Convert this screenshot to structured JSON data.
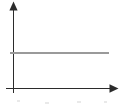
{
  "figure": {
    "title": "",
    "width": 121,
    "height": 109,
    "background_color": "#ffffff",
    "caption": ""
  },
  "axes": {
    "x_axis": {
      "name": "x-axis",
      "label": "",
      "color": "#2b2b2b",
      "arrow": "right-arrowhead",
      "start_x": 6,
      "end_x": 118,
      "y": 88,
      "ticks": [],
      "tick_labels": []
    },
    "y_axis": {
      "name": "y-axis",
      "label": "",
      "color": "#2b2b2b",
      "arrow": "up-arrowhead",
      "x": 13,
      "start_y": 93,
      "end_y": 2,
      "ticks": [],
      "tick_labels": []
    }
  },
  "legend": {
    "visible": false,
    "entries": []
  },
  "chart_data": {
    "type": "line",
    "title": "",
    "subtitle": "",
    "xlabel": "",
    "ylabel": "",
    "grid": false,
    "legend_position": "none",
    "xlim": [
      0,
      1
    ],
    "ylim": [
      0,
      1
    ],
    "axis_tick_labels": {
      "x": [],
      "y": []
    },
    "annotations": [],
    "series": [
      {
        "name": "constant-line",
        "color": "#9a9a9a",
        "style": "solid",
        "x": [
          0.08,
          0.9
        ],
        "y": [
          0.52,
          0.52
        ],
        "description": "horizontal constant line"
      }
    ]
  }
}
